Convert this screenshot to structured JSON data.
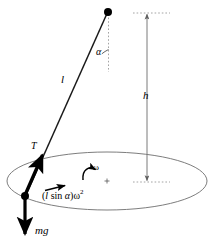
{
  "figure": {
    "type": "physics-diagram",
    "background_color": "#ffffff",
    "stroke_color": "#000000",
    "light_stroke_color": "#8c8c8c",
    "width": 214,
    "height": 249
  },
  "labels": {
    "angle": "α",
    "string_length": "l",
    "height": "h",
    "tension": "T",
    "angular_velocity": "ω",
    "weight": "mg",
    "centripetal_prefix": "(",
    "centripetal_l": "l",
    "centripetal_sin": " sin ",
    "centripetal_alpha": "α",
    "centripetal_close": ")",
    "centripetal_omega": "ω",
    "centripetal_exponent": "2",
    "centripetal_full": "(l sin α)ω²"
  },
  "geometry": {
    "pivot": {
      "x": 108,
      "y": 12
    },
    "bob": {
      "x": 25,
      "y": 196
    },
    "circle_center": {
      "x": 107,
      "y": 181
    },
    "circle_rx": 100,
    "circle_ry": 29,
    "height_line_x": 147,
    "height_top_y": 13,
    "height_bottom_y": 182,
    "weight_arrow_tip": {
      "x": 25,
      "y": 240
    }
  }
}
